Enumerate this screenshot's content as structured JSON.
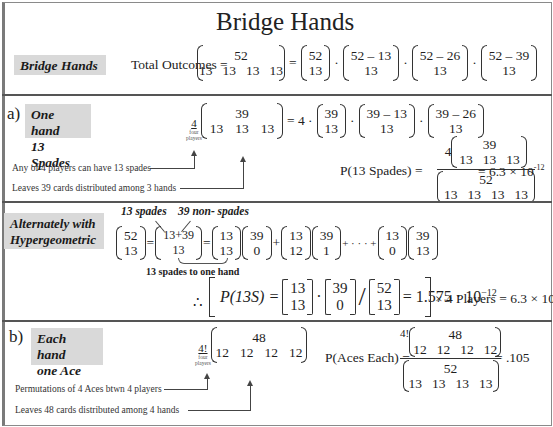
{
  "page": {
    "title": "Bridge Hands"
  },
  "section_intro": {
    "label": "Bridge Hands",
    "lhs": "Total Outcomes =",
    "multinomial": {
      "top": "52",
      "bottom": [
        "13",
        "13",
        "13",
        "13"
      ]
    },
    "factors": [
      {
        "top": "52",
        "bottom": "13"
      },
      {
        "top": "52 – 13",
        "bottom": "13"
      },
      {
        "top": "52 – 26",
        "bottom": "13"
      },
      {
        "top": "52 – 39",
        "bottom": "13"
      }
    ],
    "eq": "=",
    "dot": "·"
  },
  "section_a": {
    "part": "a)",
    "label_line1": "One hand",
    "label_line2": "13 Spades",
    "coef": "4",
    "coef_note_line1": "four",
    "coef_note_line2": "players",
    "multinomial": {
      "top": "39",
      "bottom": [
        "13",
        "13",
        "13"
      ]
    },
    "rhs_prefix": "= 4 ·",
    "factors": [
      {
        "top": "39",
        "bottom": "13"
      },
      {
        "top": "39 – 13",
        "bottom": "13"
      },
      {
        "top": "39 – 26",
        "bottom": "13"
      }
    ],
    "annotation_1": "Any of 4 players can have 13 spades",
    "annotation_2": "Leaves 39 cards distributed among 3 hands",
    "prob_lhs": "P(13 Spades) =",
    "prob_num_coef": "4",
    "prob_num": {
      "top": "39",
      "bottom": [
        "13",
        "13",
        "13"
      ]
    },
    "prob_den": {
      "top": "52",
      "bottom": [
        "13",
        "13",
        "13",
        "13"
      ]
    },
    "prob_result": "= 6.3 × 10",
    "prob_exp": "-12"
  },
  "section_hyper": {
    "label_line1": "Alternately with",
    "label_line2": "Hypergeometric",
    "note_spades": "13 spades",
    "note_nonspades": "39 non- spades",
    "terms": [
      {
        "top": "52",
        "bottom": "13"
      },
      {
        "top": "13+39",
        "bottom": "13"
      },
      {
        "top": "13",
        "bottom": "13"
      },
      {
        "top": "39",
        "bottom": "0"
      },
      {
        "top": "13",
        "bottom": "12"
      },
      {
        "top": "39",
        "bottom": "1"
      },
      {
        "top": "13",
        "bottom": "0"
      },
      {
        "top": "39",
        "bottom": "13"
      }
    ],
    "ellipsis": "+ · · · +",
    "brace_note": "13 spades to one hand",
    "therefore": "∴",
    "p_lhs": "P(13S) =",
    "p_factors": [
      {
        "top": "13",
        "bottom": "13"
      },
      {
        "top": "39",
        "bottom": "0"
      },
      {
        "top": "52",
        "bottom": "13"
      }
    ],
    "p_value": "= 1.575 · 10",
    "p_value_exp": "−12",
    "p_tail": "× 4 Players = 6.3 × 10",
    "p_tail_exp": "-12"
  },
  "section_b": {
    "part": "b)",
    "label_line1": "Each hand",
    "label_line2": "one Ace",
    "coef": "4!",
    "coef_note_line1": "four",
    "coef_note_line2": "players",
    "multinomial": {
      "top": "48",
      "bottom": [
        "12",
        "12",
        "12",
        "12"
      ]
    },
    "annotation_1": "Permutations of 4 Aces btwn 4 players",
    "annotation_2": "Leaves 48 cards distributed among 4 hands",
    "prob_lhs": "P(Aces Each) =",
    "prob_num_coef": "4!",
    "prob_num": {
      "top": "48",
      "bottom": [
        "12",
        "12",
        "12",
        "12"
      ]
    },
    "prob_den": {
      "top": "52",
      "bottom": [
        "13",
        "13",
        "13",
        "13"
      ]
    },
    "prob_result": "= .105"
  }
}
